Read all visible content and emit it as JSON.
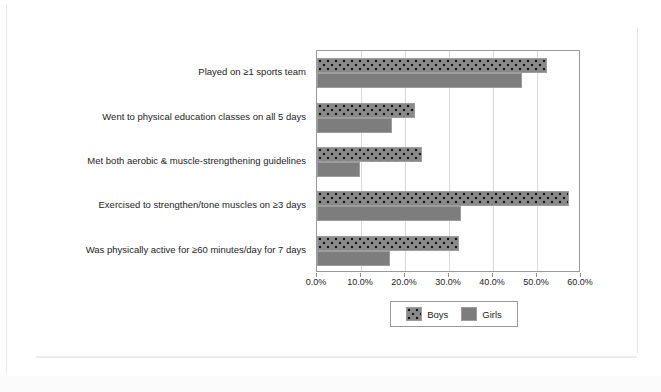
{
  "chart_data": {
    "type": "bar",
    "orientation": "horizontal",
    "title": "",
    "subtitle": "",
    "xlabel": "",
    "ylabel": "",
    "xlim": [
      0,
      60
    ],
    "xticks": [
      0,
      10,
      20,
      30,
      40,
      50,
      60
    ],
    "xtick_labels": [
      "0.0%",
      "10.0%",
      "20.0%",
      "30.0%",
      "40.0%",
      "50.0%",
      "60.0%"
    ],
    "grid": true,
    "grid_axis": "x",
    "legend_position": "bottom",
    "categories": [
      "Played on ≥1 sports team",
      "Went to physical education classes on all 5 days",
      "Met both aerobic & muscle-strengthening guidelines",
      "Exercised to strengthen/tone muscles on ≥3 days",
      "Was physically active for ≥60 minutes/day for 7 days"
    ],
    "series": [
      {
        "name": "Boys",
        "fill": "dotted-pattern",
        "color": "#8a8a8a",
        "values": [
          52.3,
          22.3,
          23.9,
          57.3,
          32.2
        ]
      },
      {
        "name": "Girls",
        "fill": "solid",
        "color": "#7d7d7d",
        "values": [
          46.6,
          17.0,
          9.8,
          32.7,
          16.6
        ]
      }
    ]
  },
  "legend": {
    "items": [
      {
        "label": "Boys"
      },
      {
        "label": "Girls"
      }
    ]
  },
  "colors": {
    "boys": "#8a8a8a",
    "girls": "#7d7d7d",
    "axis": "#9a9a9a",
    "gridline": "#d9d9d9",
    "text": "#1c1c1c",
    "page_background": "#ffffff"
  }
}
